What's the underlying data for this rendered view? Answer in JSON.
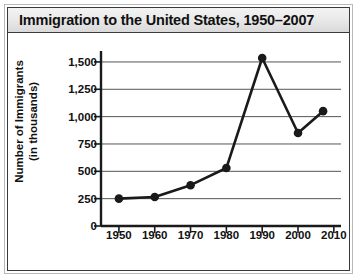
{
  "chart_data": {
    "type": "line",
    "title": "Immigration to the United States, 1950–2007",
    "xlabel": "Year",
    "ylabel": "Number of Immigrants\n(in thousands)",
    "ylabel_line1": "Number of Immigrants",
    "ylabel_line2": "(in thousands)",
    "x": [
      1950,
      1960,
      1970,
      1980,
      1990,
      2000,
      2007
    ],
    "values": [
      250,
      265,
      373,
      530,
      1536,
      850,
      1050
    ],
    "xlim": [
      1945,
      2012
    ],
    "ylim": [
      0,
      1600
    ],
    "xticks": [
      1950,
      1960,
      1970,
      1980,
      1990,
      2000,
      2010
    ],
    "xtick_labels": [
      "1950",
      "1960",
      "1970",
      "1980",
      "1990",
      "2000",
      "2010"
    ],
    "yticks": [
      0,
      250,
      500,
      750,
      1000,
      1250,
      1500
    ],
    "ytick_labels": [
      "0",
      "250",
      "500",
      "750",
      "1,000",
      "1,250",
      "1,500"
    ],
    "grid": "horizontal",
    "legend": "none",
    "series_color": "#1a1a1a",
    "marker": "circle",
    "gridline_color": "#555555",
    "axis_color": "#1a1a1a",
    "title_bar_color": "#e6e6e6",
    "background_color": "#ffffff"
  }
}
